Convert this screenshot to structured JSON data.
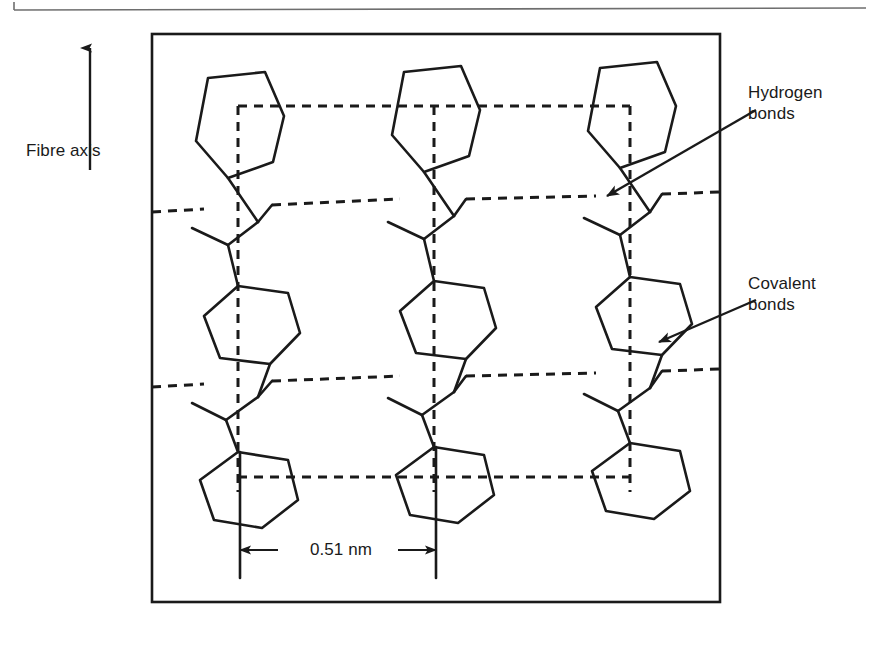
{
  "figure": {
    "type": "molecular-structure-diagram",
    "background_color": "#ffffff",
    "line_color": "#1a1a1a"
  },
  "labels": {
    "fibre_axis": "Fibre axis",
    "hydrogen_bonds_line1": "Hydrogen",
    "hydrogen_bonds_line2": "bonds",
    "covalent_bonds_line1": "Covalent",
    "covalent_bonds_line2": "bonds",
    "scale": "0.51 nm"
  },
  "annotations": [
    {
      "name": "fibre-axis-arrow",
      "direction": "up",
      "label": "Fibre axis"
    },
    {
      "name": "hydrogen-bonds-leader",
      "points_to": "horizontal dashed line between chains",
      "label": "Hydrogen bonds"
    },
    {
      "name": "covalent-bonds-leader",
      "points_to": "solid bond in polymer backbone",
      "label": "Covalent bonds"
    },
    {
      "name": "scale-bar",
      "label": "0.51 nm",
      "measures": "inter-chain spacing"
    }
  ],
  "legend_semantics": {
    "solid_line": "covalent bonds within polymer chain",
    "dashed_line": "hydrogen bonds between adjacent chains",
    "hexagon": "aromatic benzene ring"
  },
  "frame": {
    "x": 152,
    "y": 34,
    "width": 568,
    "height": 568
  }
}
